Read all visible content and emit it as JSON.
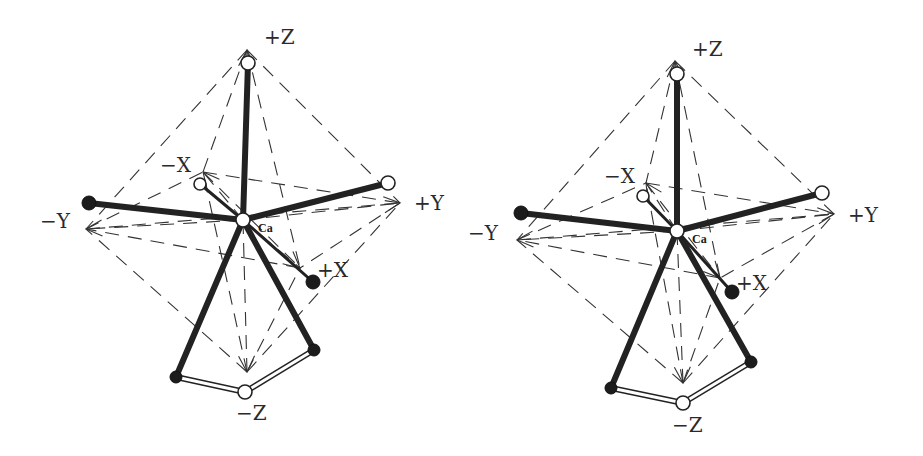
{
  "figure": {
    "central_atom_label": "Ca",
    "axis_labels": {
      "plus_z": "+Z",
      "minus_z": "−Z",
      "plus_y": "+Y",
      "minus_y": "−Y",
      "plus_x": "+X",
      "minus_x": "−X"
    },
    "colors": {
      "line": "#222222",
      "dash": "#333333",
      "background": "#ffffff",
      "filled_atom": "#1c1c1c",
      "open_atom": "#ffffff"
    }
  },
  "panels": [
    {
      "name": "left-view",
      "ca": {
        "x": 243,
        "y": 220,
        "r": 7
      },
      "ca_label_pos": {
        "x": 258,
        "y": 232
      },
      "tips": {
        "pz": {
          "x": 247,
          "y": 50
        },
        "mz": {
          "x": 247,
          "y": 372
        },
        "py": {
          "x": 400,
          "y": 203
        },
        "my": {
          "x": 86,
          "y": 229
        },
        "px": {
          "x": 300,
          "y": 268
        },
        "mx": {
          "x": 203,
          "y": 172
        }
      },
      "labels": {
        "pz": {
          "x": 264,
          "y": 44
        },
        "mz": {
          "x": 236,
          "y": 420
        },
        "py": {
          "x": 414,
          "y": 210
        },
        "my": {
          "x": 40,
          "y": 228
        },
        "px": {
          "x": 317,
          "y": 277
        },
        "mx": {
          "x": 160,
          "y": 172
        }
      },
      "atoms": [
        {
          "id": "top",
          "x": 248,
          "y": 63,
          "r": 7,
          "type": "open"
        },
        {
          "id": "minus-x",
          "x": 200,
          "y": 184,
          "r": 6,
          "type": "open"
        },
        {
          "id": "minus-y",
          "x": 89,
          "y": 203,
          "r": 7,
          "type": "filled"
        },
        {
          "id": "plus-y",
          "x": 388,
          "y": 183,
          "r": 7,
          "type": "open"
        },
        {
          "id": "plus-x",
          "x": 313,
          "y": 282,
          "r": 7,
          "type": "filled"
        },
        {
          "id": "lower-right",
          "x": 314,
          "y": 350,
          "r": 6,
          "type": "filled"
        },
        {
          "id": "lower-left",
          "x": 176,
          "y": 377,
          "r": 6,
          "type": "filled"
        },
        {
          "id": "bottom",
          "x": 245,
          "y": 392,
          "r": 7,
          "type": "open"
        }
      ]
    },
    {
      "name": "right-view",
      "ca": {
        "x": 677,
        "y": 231,
        "r": 7
      },
      "ca_label_pos": {
        "x": 692,
        "y": 243
      },
      "tips": {
        "pz": {
          "x": 675,
          "y": 61
        },
        "mz": {
          "x": 683,
          "y": 383
        },
        "py": {
          "x": 834,
          "y": 214
        },
        "my": {
          "x": 517,
          "y": 240
        },
        "px": {
          "x": 720,
          "y": 278
        },
        "mx": {
          "x": 646,
          "y": 183
        }
      },
      "labels": {
        "pz": {
          "x": 692,
          "y": 56
        },
        "mz": {
          "x": 672,
          "y": 432
        },
        "py": {
          "x": 848,
          "y": 222
        },
        "my": {
          "x": 468,
          "y": 240
        },
        "px": {
          "x": 736,
          "y": 290
        },
        "mx": {
          "x": 604,
          "y": 183
        }
      },
      "atoms": [
        {
          "id": "top",
          "x": 677,
          "y": 74,
          "r": 7,
          "type": "open"
        },
        {
          "id": "minus-x",
          "x": 643,
          "y": 196,
          "r": 6,
          "type": "open"
        },
        {
          "id": "minus-y",
          "x": 521,
          "y": 213,
          "r": 7,
          "type": "filled"
        },
        {
          "id": "plus-y",
          "x": 822,
          "y": 193,
          "r": 7,
          "type": "open"
        },
        {
          "id": "plus-x",
          "x": 732,
          "y": 292,
          "r": 7,
          "type": "filled"
        },
        {
          "id": "lower-right",
          "x": 751,
          "y": 362,
          "r": 6,
          "type": "filled"
        },
        {
          "id": "lower-left",
          "x": 611,
          "y": 388,
          "r": 6,
          "type": "filled"
        },
        {
          "id": "bottom",
          "x": 683,
          "y": 403,
          "r": 7,
          "type": "open"
        }
      ]
    }
  ],
  "octahedron_edges": [
    [
      "pz",
      "my"
    ],
    [
      "pz",
      "mx"
    ],
    [
      "pz",
      "px"
    ],
    [
      "pz",
      "py"
    ],
    [
      "mz",
      "my"
    ],
    [
      "mz",
      "mx"
    ],
    [
      "mz",
      "px"
    ],
    [
      "mz",
      "py"
    ],
    [
      "my",
      "mx"
    ],
    [
      "mx",
      "py"
    ],
    [
      "py",
      "px"
    ],
    [
      "px",
      "my"
    ],
    [
      "mx",
      "px"
    ],
    [
      "my",
      "py"
    ],
    [
      "pz",
      "mz"
    ]
  ],
  "bonds": [
    {
      "to": "top",
      "style": "thick"
    },
    {
      "to": "minus-y",
      "style": "thick"
    },
    {
      "to": "plus-y",
      "style": "thick"
    },
    {
      "to": "minus-x",
      "style": "thin"
    },
    {
      "to": "plus-x",
      "style": "thin"
    },
    {
      "to": "lower-left",
      "style": "thick"
    },
    {
      "to": "lower-right",
      "style": "thick"
    }
  ],
  "ring_bonds": [
    [
      "lower-left",
      "bottom"
    ],
    [
      "bottom",
      "lower-right"
    ]
  ]
}
